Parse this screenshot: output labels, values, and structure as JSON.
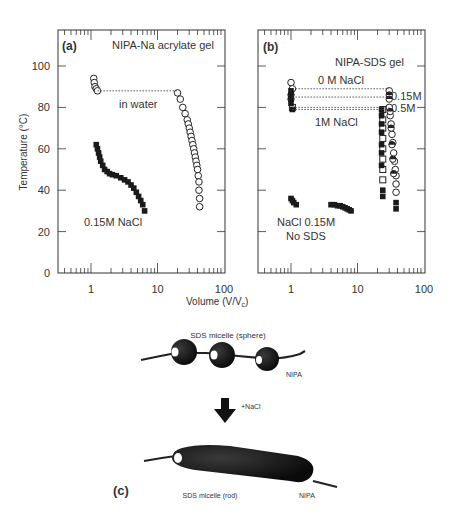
{
  "figure": {
    "panel_c": {
      "label": "(c)",
      "sphere_title": "SDS micelle (sphere)",
      "sphere_polymer_label": "NIPA",
      "arrow_label": "+NaCl",
      "rod_title": "SDS micelle (rod)",
      "rod_polymer_label": "NIPA"
    },
    "shared": {
      "ylabel": "Temperature (°C)",
      "xlabel": "Volume (V/V",
      "xlabel_sub": "c",
      "xlabel_close": ")"
    }
  },
  "chart_data": [
    {
      "type": "scatter",
      "panel": "(a)",
      "title": "NIPA-Na acrylate gel",
      "xlabel": "Volume (V/Vc)",
      "ylabel": "Temperature (°C)",
      "xscale": "log",
      "xlim": [
        0.32,
        100
      ],
      "ylim": [
        0,
        115
      ],
      "xticks": [
        "1",
        "10",
        "100"
      ],
      "yticks": [
        "0",
        "20",
        "40",
        "60",
        "80",
        "100"
      ],
      "grid": false,
      "annotations": [
        "in water",
        "0.15M NaCl"
      ],
      "series": [
        {
          "name": "in water",
          "marker": "open-circle",
          "x": [
            1.1,
            1.12,
            1.15,
            1.2,
            1.25,
            20,
            22,
            24,
            26,
            28,
            29,
            30,
            31,
            32,
            33,
            34,
            35,
            36,
            37,
            38,
            39,
            40,
            41,
            42,
            42,
            43,
            43
          ],
          "y": [
            94,
            92,
            90,
            89,
            88,
            87,
            84,
            80,
            77,
            74,
            72,
            70,
            68,
            66,
            64,
            62,
            60,
            58,
            56,
            54,
            52,
            50,
            47,
            44,
            40,
            36,
            32
          ]
        },
        {
          "name": "0.15M NaCl",
          "marker": "filled-square",
          "x": [
            1.2,
            1.25,
            1.3,
            1.35,
            1.4,
            1.5,
            1.6,
            1.75,
            1.9,
            2.1,
            2.4,
            2.8,
            3.2,
            3.6,
            4.0,
            4.4,
            4.8,
            5.2,
            5.6,
            6.0,
            6.4
          ],
          "y": [
            62,
            60,
            58,
            56,
            54,
            52,
            50,
            49,
            48,
            47.5,
            47,
            46,
            45,
            44,
            42.5,
            41,
            39,
            37,
            35,
            33,
            30
          ]
        },
        {
          "name": "transition-tie-line",
          "marker": "dotted-line",
          "x": [
            1.25,
            20
          ],
          "y": [
            88,
            88
          ]
        }
      ]
    },
    {
      "type": "scatter",
      "panel": "(b)",
      "title": "NIPA-SDS gel",
      "xlabel": "Volume (V/Vc)",
      "ylabel": "Temperature (°C)",
      "xscale": "log",
      "xlim": [
        0.32,
        100
      ],
      "ylim": [
        0,
        115
      ],
      "xticks": [
        "1",
        "10",
        "100"
      ],
      "yticks": [
        "0",
        "20",
        "40",
        "60",
        "80",
        "100"
      ],
      "grid": false,
      "annotations": [
        "0 M NaCl",
        "0.15M",
        "0.5M",
        "1M NaCl",
        "NaCl 0.15M",
        "No SDS"
      ],
      "series": [
        {
          "name": "0 M NaCl",
          "marker": "open-circle",
          "x": [
            1.0,
            1.05,
            30,
            30,
            31,
            32,
            33,
            34,
            35,
            36,
            37,
            38,
            38,
            38
          ],
          "y": [
            92,
            89,
            88,
            80,
            76,
            72,
            67,
            63,
            58,
            54,
            50,
            47,
            43,
            39
          ]
        },
        {
          "name": "0.15M NaCl",
          "marker": "half-filled-circle",
          "x": [
            1.0,
            1.0,
            30,
            30,
            31,
            32,
            33,
            34,
            35
          ],
          "y": [
            86,
            84,
            86,
            84,
            78,
            70,
            62,
            55,
            48
          ]
        },
        {
          "name": "0.5M NaCl",
          "marker": "open-square",
          "x": [
            1.05,
            24,
            24,
            24,
            24,
            24,
            24,
            24,
            24
          ],
          "y": [
            80,
            79,
            74,
            70,
            65,
            60,
            55,
            50,
            45
          ]
        },
        {
          "name": "1M NaCl",
          "marker": "filled-square",
          "x": [
            1.0,
            1.0,
            1.0,
            1.0,
            1.05,
            23,
            23,
            23,
            23,
            23,
            23,
            23,
            24,
            24,
            38,
            38
          ],
          "y": [
            88,
            86,
            84,
            82,
            79,
            79,
            76,
            72,
            68,
            62,
            58,
            52,
            40,
            37,
            34,
            31
          ]
        },
        {
          "name": "NaCl 0.15M, No SDS",
          "marker": "filled-square",
          "x": [
            1.0,
            1.05,
            1.1,
            1.2,
            4.0,
            4.5,
            5.0,
            5.5,
            6.0,
            6.5,
            7.0,
            7.5,
            8.0
          ],
          "y": [
            36,
            35,
            34,
            33,
            33,
            33,
            32.5,
            32.5,
            32,
            31.5,
            31,
            30.5,
            30
          ]
        },
        {
          "name": "tie-lines",
          "marker": "dotted-line",
          "x": [
            1.05,
            30
          ],
          "y": [
            89,
            89
          ]
        }
      ]
    }
  ]
}
